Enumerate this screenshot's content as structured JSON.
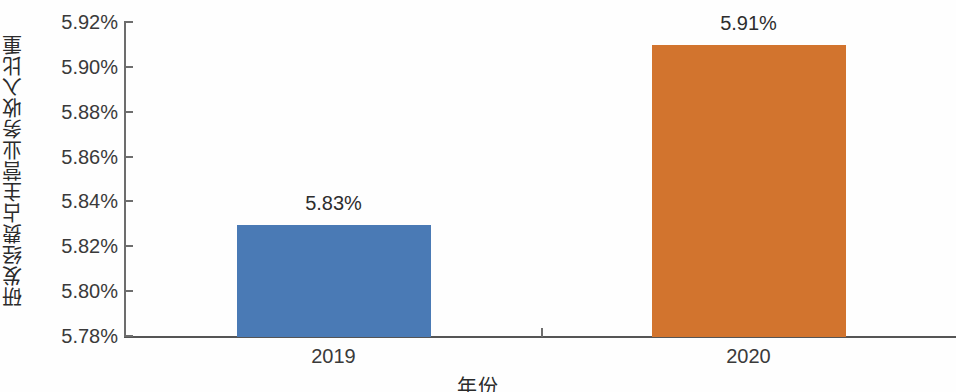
{
  "chart_data": {
    "type": "bar",
    "title": "",
    "subtitle": "",
    "xlabel": "年份",
    "ylabel": "研发经费占主营业务收入比重",
    "categories": [
      "2019",
      "2020"
    ],
    "values": [
      5.83,
      5.91
    ],
    "value_labels": [
      "5.83%",
      "5.91%"
    ],
    "series": [
      {
        "name": "研发经费占主营业务收入比重",
        "values": [
          5.83,
          5.91
        ],
        "colors": [
          "#4a7ab5",
          "#d2742e"
        ]
      }
    ],
    "ylim": [
      5.78,
      5.92
    ],
    "ytick_values": [
      5.92,
      5.9,
      5.88,
      5.86,
      5.84,
      5.82,
      5.8,
      5.78
    ],
    "ytick_labels": [
      "5.92%",
      "5.90%",
      "5.88%",
      "5.86%",
      "5.84%",
      "5.82%",
      "5.80%",
      "5.78%"
    ],
    "grid": false,
    "legend": "none",
    "bar_colors": {
      "2019": "#4a7ab5",
      "2020": "#d2742e"
    },
    "axis_color": "#6d6d6d",
    "background": "#fefefe"
  }
}
